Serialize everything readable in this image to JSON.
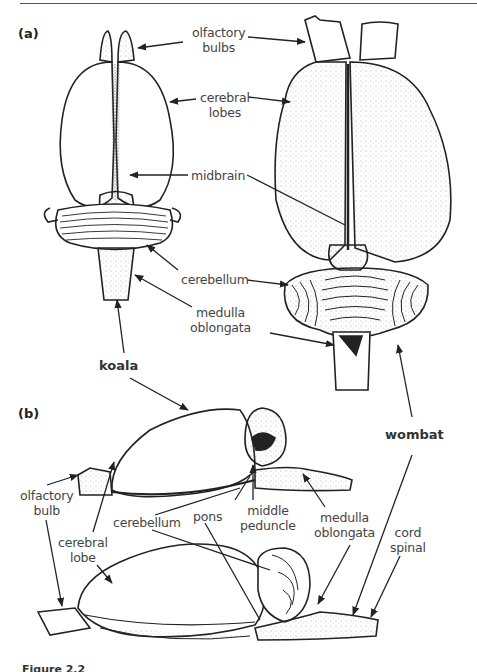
{
  "figure": {
    "caption_partial": "Figure 2.2",
    "panels": {
      "a": {
        "tag": "(a)",
        "view": "dorsal"
      },
      "b": {
        "tag": "(b)",
        "view": "lateral"
      }
    },
    "species": {
      "koala": "koala",
      "wombat": "wombat"
    },
    "labels_a": {
      "olfactory_bulbs": [
        "olfactory",
        "bulbs"
      ],
      "cerebral_lobes": [
        "cerebral",
        "lobes"
      ],
      "midbrain": "midbrain",
      "cerebellum": "cerebellum",
      "medulla_oblongata": [
        "medulla",
        "oblongata"
      ]
    },
    "labels_b": {
      "olfactory_bulb": [
        "olfactory",
        "bulb"
      ],
      "cerebral_lobe": [
        "cerebral",
        "lobe"
      ],
      "cerebellum": "cerebellum",
      "pons": "pons",
      "middle_peduncle": [
        "middle",
        "peduncle"
      ],
      "medulla_oblongata": [
        "medulla",
        "oblongata"
      ],
      "spinal_cord": [
        "cord",
        "spinal"
      ]
    },
    "colors": {
      "ink": "#222222",
      "label": "#444444",
      "background": "#ffffff"
    }
  }
}
